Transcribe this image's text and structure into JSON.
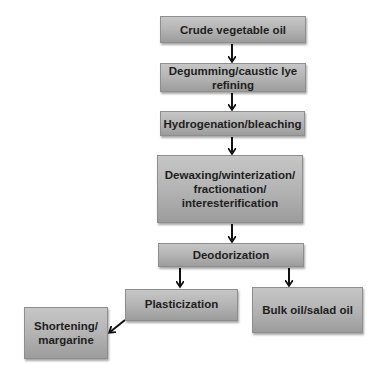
{
  "diagram": {
    "type": "flowchart",
    "nodes": [
      {
        "id": "crude",
        "label": "Crude vegetable oil"
      },
      {
        "id": "degum",
        "label": "Degumming/caustic lye\nrefining"
      },
      {
        "id": "hydro",
        "label": "Hydrogenation/bleaching"
      },
      {
        "id": "dewax",
        "label": "Dewaxing/winterization/\nfractionation/\ninteresterification"
      },
      {
        "id": "deodor",
        "label": "Deodorization"
      },
      {
        "id": "plastic",
        "label": "Plasticization"
      },
      {
        "id": "bulk",
        "label": "Bulk oil/salad oil"
      },
      {
        "id": "short",
        "label": "Shortening/\nmargarine"
      }
    ],
    "edges": [
      {
        "from": "crude",
        "to": "degum"
      },
      {
        "from": "degum",
        "to": "hydro"
      },
      {
        "from": "hydro",
        "to": "dewax"
      },
      {
        "from": "dewax",
        "to": "deodor"
      },
      {
        "from": "deodor",
        "to": "plastic"
      },
      {
        "from": "deodor",
        "to": "bulk"
      },
      {
        "from": "plastic",
        "to": "short"
      }
    ],
    "colors": {
      "box_fill": "#b4b4b4",
      "arrow": "#111111",
      "text": "#1e1e1e"
    }
  }
}
